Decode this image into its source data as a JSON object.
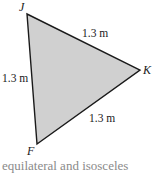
{
  "diagram": {
    "type": "triangle",
    "fill_color": "#d0d0d0",
    "stroke_color": "#1a1a1a",
    "vertices": [
      {
        "name": "J",
        "x": 27,
        "y": 14
      },
      {
        "name": "K",
        "x": 140,
        "y": 70
      },
      {
        "name": "F",
        "x": 37,
        "y": 144
      }
    ],
    "vertex_labels": {
      "J": "J",
      "K": "K",
      "F": "F"
    },
    "side_labels": {
      "JK": "1.3 m",
      "JF": "1.3 m",
      "KF": "1.3 m"
    }
  },
  "caption": "equilateral and isosceles"
}
